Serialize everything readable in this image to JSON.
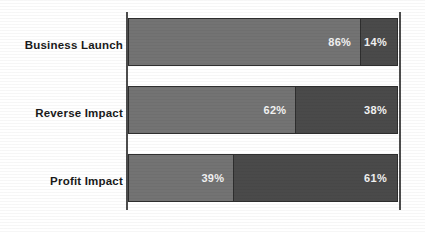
{
  "chart_data": {
    "type": "bar",
    "orientation": "horizontal",
    "stacked": true,
    "normalized_percent": true,
    "title": "",
    "subtitle": "",
    "xlabel": "",
    "ylabel": "",
    "xlim": [
      0,
      100
    ],
    "grid": false,
    "legend": "none",
    "categories": [
      "Business Launch",
      "Reverse Impact",
      "Profit Impact"
    ],
    "series": [
      {
        "name": "Segment A",
        "color": "#737373",
        "values": [
          86,
          62,
          39
        ],
        "labels": [
          "86%",
          "62%",
          "39%"
        ]
      },
      {
        "name": "Segment B",
        "color": "#4a4a4a",
        "values": [
          14,
          38,
          61
        ],
        "labels": [
          "14%",
          "38%",
          "61%"
        ]
      }
    ],
    "rows": [
      {
        "category": "Business Launch",
        "a_value": 86,
        "a_label": "86%",
        "b_value": 14,
        "b_label": "14%"
      },
      {
        "category": "Reverse Impact",
        "a_value": 62,
        "a_label": "62%",
        "b_value": 38,
        "b_label": "38%"
      },
      {
        "category": "Profit Impact",
        "a_value": 39,
        "a_label": "39%",
        "b_value": 61,
        "b_label": "61%"
      }
    ]
  },
  "colors": {
    "background": "#ffffff",
    "segment_a": "#737373",
    "segment_b": "#4a4a4a",
    "axis": "#4d4d4d",
    "bar_outline": "#2e2e2e",
    "category_text": "#1a1a1a",
    "value_text": "#f2f2f2"
  }
}
